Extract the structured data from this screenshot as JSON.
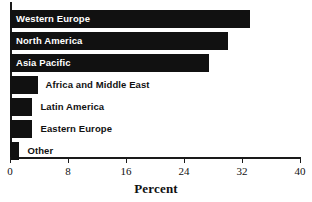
{
  "chart_data": {
    "type": "bar",
    "orientation": "horizontal",
    "title": "",
    "xlabel": "Percent",
    "ylabel": "",
    "xlim": [
      0,
      40
    ],
    "xticks": [
      0,
      8,
      16,
      24,
      32,
      40
    ],
    "xtick_labels": [
      "0",
      "8",
      "16",
      "24",
      "32",
      "40"
    ],
    "grid": false,
    "legend": null,
    "bar_color": "#111111",
    "categories": [
      "Western Europe",
      "North America",
      "Asia Pacific",
      "Africa and Middle East",
      "Latin America",
      "Eastern Europe",
      "Other"
    ],
    "values": [
      33.1,
      30.0,
      27.4,
      3.8,
      3.1,
      3.1,
      1.3
    ],
    "label_placement": [
      "inside",
      "inside",
      "inside",
      "outside",
      "outside",
      "outside",
      "outside"
    ]
  },
  "axis": {
    "title": "Percent"
  }
}
